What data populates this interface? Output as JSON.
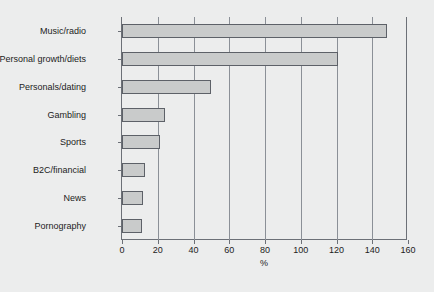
{
  "chart_data": {
    "type": "bar",
    "orientation": "horizontal",
    "title": "",
    "subtitle": "",
    "xlabel": "%",
    "ylabel": "",
    "categories": [
      "Music/radio",
      "Personal growth/diets",
      "Personals/dating",
      "Gambling",
      "Sports",
      "B2C/financial",
      "News",
      "Pornography"
    ],
    "values": [
      148,
      121,
      50,
      24,
      21,
      13,
      12,
      11
    ],
    "xlim": [
      0,
      160
    ],
    "xticks": [
      0,
      20,
      40,
      60,
      80,
      100,
      120,
      140,
      160
    ],
    "xtick_labels": [
      "0",
      "20",
      "40",
      "60",
      "80",
      "100",
      "120",
      "140",
      "160"
    ],
    "grid": "vertical",
    "legend": null,
    "colors": {
      "background": "#eceded",
      "bar_fill": "#c9cbcb",
      "bar_edge": "#5d6168",
      "axis": "#6c7077",
      "gridline": "#8b9097",
      "text": "#1c1c1c"
    }
  }
}
